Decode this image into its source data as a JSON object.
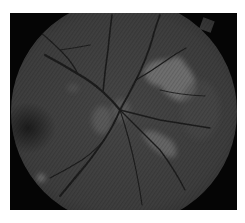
{
  "image": {
    "subject": "retinal fundus photograph (grayscale)",
    "border_color": "#ffffff",
    "background_color": "#050505",
    "fundus_base_color": "#414141",
    "features": [
      {
        "name": "optic-disc",
        "cx": 118,
        "cy": 107
      },
      {
        "name": "macula-dark-spot",
        "cx": 28,
        "cy": 128
      },
      {
        "name": "bright-exudate-upper-right",
        "cx": 170,
        "cy": 78
      },
      {
        "name": "bright-exudate-lower-right",
        "cx": 163,
        "cy": 145
      },
      {
        "name": "small-bright-spot-lower-left",
        "cx": 41,
        "cy": 178
      },
      {
        "name": "bright-patch-left-of-disc",
        "cx": 100,
        "cy": 122
      },
      {
        "name": "notch-tab-top-right",
        "cx": 207,
        "cy": 25
      }
    ]
  }
}
